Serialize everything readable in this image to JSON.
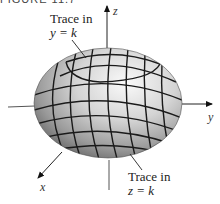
{
  "figure": {
    "caption_partial": "FIGURE 11.7",
    "labels": {
      "trace_y": {
        "line1": "Trace in",
        "line2": "y = k"
      },
      "trace_z": {
        "line1": "Trace in",
        "line2": "z = k"
      }
    },
    "axes": {
      "x": "x",
      "y": "y",
      "z": "z"
    },
    "surface": {
      "type": "ellipsoid",
      "fill_light": "#f0f0f0",
      "fill_dark": "#6e6e6e",
      "grid_color": "#1a1a1a"
    }
  }
}
